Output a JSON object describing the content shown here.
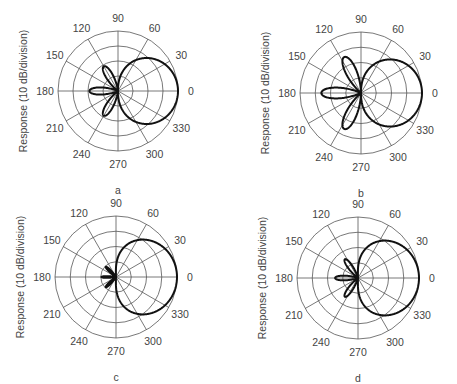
{
  "figure": {
    "ylabel": "Response (10 dB/division)",
    "angle_labels": [
      "0",
      "30",
      "60",
      "90",
      "120",
      "150",
      "180",
      "210",
      "240",
      "270",
      "300",
      "330"
    ]
  },
  "chart_data": [
    {
      "type": "polar",
      "panel": "a",
      "title": "a",
      "ylabel": "Response (10 dB/division)",
      "angular_ticks_deg": [
        0,
        30,
        60,
        90,
        120,
        150,
        180,
        210,
        240,
        270,
        300,
        330
      ],
      "radial_divisions": 4,
      "db_per_division": 10,
      "grid": true,
      "center_px": [
        118,
        91
      ],
      "outer_radius_px": 60,
      "lobes": [
        {
          "direction_deg": 0,
          "half_width_deg": 90,
          "max_radius_div": 4.0,
          "shape": "main-cardioid"
        },
        {
          "direction_deg": 120,
          "half_width_deg": 22,
          "max_radius_div": 1.9
        },
        {
          "direction_deg": 180,
          "half_width_deg": 22,
          "max_radius_div": 1.9
        },
        {
          "direction_deg": 240,
          "half_width_deg": 22,
          "max_radius_div": 1.9
        }
      ]
    },
    {
      "type": "polar",
      "panel": "b",
      "title": "b",
      "ylabel": "Response (10 dB/division)",
      "angular_ticks_deg": [
        0,
        30,
        60,
        90,
        120,
        150,
        180,
        210,
        240,
        270,
        300,
        330
      ],
      "radial_divisions": 4,
      "db_per_division": 10,
      "grid": true,
      "center_px": [
        361,
        93
      ],
      "outer_radius_px": 61,
      "lobes": [
        {
          "direction_deg": 0,
          "half_width_deg": 90,
          "max_radius_div": 4.0,
          "shape": "main-cardioid"
        },
        {
          "direction_deg": 115,
          "half_width_deg": 24,
          "max_radius_div": 2.6
        },
        {
          "direction_deg": 180,
          "half_width_deg": 24,
          "max_radius_div": 2.6
        },
        {
          "direction_deg": 245,
          "half_width_deg": 24,
          "max_radius_div": 2.6
        }
      ]
    },
    {
      "type": "polar",
      "panel": "c",
      "title": "c",
      "ylabel": "Response (10 dB/division)",
      "angular_ticks_deg": [
        0,
        30,
        60,
        90,
        120,
        150,
        180,
        210,
        240,
        270,
        300,
        330
      ],
      "radial_divisions": 4,
      "db_per_division": 10,
      "grid": true,
      "center_px": [
        116,
        277
      ],
      "outer_radius_px": 61,
      "lobes": [
        {
          "direction_deg": 0,
          "half_width_deg": 92,
          "max_radius_div": 4.0,
          "shape": "main-cardioid-wide"
        },
        {
          "direction_deg": 135,
          "half_width_deg": 12,
          "max_radius_div": 0.95
        },
        {
          "direction_deg": 180,
          "half_width_deg": 10,
          "max_radius_div": 0.95
        },
        {
          "direction_deg": 225,
          "half_width_deg": 12,
          "max_radius_div": 0.95
        }
      ]
    },
    {
      "type": "polar",
      "panel": "d",
      "title": "d",
      "ylabel": "Response (10 dB/division)",
      "angular_ticks_deg": [
        0,
        30,
        60,
        90,
        120,
        150,
        180,
        210,
        240,
        270,
        300,
        330
      ],
      "radial_divisions": 4,
      "db_per_division": 10,
      "grid": true,
      "center_px": [
        358,
        278
      ],
      "outer_radius_px": 61,
      "lobes": [
        {
          "direction_deg": 0,
          "half_width_deg": 92,
          "max_radius_div": 4.0,
          "shape": "main-cardioid-wide"
        },
        {
          "direction_deg": 125,
          "half_width_deg": 18,
          "max_radius_div": 1.5
        },
        {
          "direction_deg": 180,
          "half_width_deg": 18,
          "max_radius_div": 1.5
        },
        {
          "direction_deg": 235,
          "half_width_deg": 18,
          "max_radius_div": 1.5
        }
      ]
    }
  ]
}
